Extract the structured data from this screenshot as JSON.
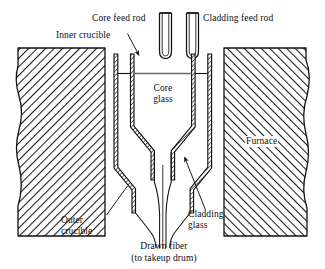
{
  "figure": {
    "stroke_color": "#111111",
    "hatch_color": "#1a1a1a",
    "background": "#ffffff"
  },
  "labels": {
    "core_feed_rod": "Core feed rod",
    "cladding_feed_rod": "Cladding feed rod",
    "inner_crucible": "Inner crucible",
    "outer_crucible_line1": "Outer",
    "outer_crucible_line2": "crucible",
    "core_glass_line1": "Core",
    "core_glass_line2": "glass",
    "cladding_glass_line1": "Cladding",
    "cladding_glass_line2": "glass",
    "furnace": "Furnace",
    "drawn_fiber_line1": "Drawn fiber",
    "drawn_fiber_line2": "(to takeup drum)"
  },
  "parts": {
    "core_feed_rod": "core-feed-rod",
    "cladding_feed_rod": "cladding-feed-rod",
    "inner_crucible": "inner-crucible",
    "outer_crucible": "outer-crucible",
    "furnace_left": "furnace-block-left",
    "furnace_right": "furnace-block-right",
    "drawn_fiber": "drawn-fiber"
  }
}
